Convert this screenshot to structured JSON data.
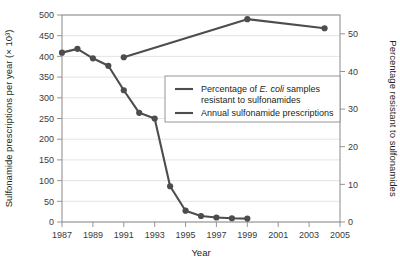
{
  "chart_data": {
    "type": "line",
    "title": "",
    "xlabel": "Year",
    "ylabel": "Sulfonamide prescriptions per year (× 10³)",
    "y2label": "Percentage resistant to sulfonamides",
    "xlim": [
      1987,
      2005
    ],
    "ylim": [
      0,
      500
    ],
    "y2lim": [
      0,
      55
    ],
    "grid": true,
    "legend_position": "center",
    "xticks": [
      1987,
      1989,
      1991,
      1993,
      1995,
      1997,
      1999,
      2001,
      2003,
      2005
    ],
    "xtick_labels": [
      "1987",
      "1989",
      "1991",
      "1993",
      "1995",
      "1997",
      "1999",
      "2001",
      "2003",
      "2005"
    ],
    "yticks": [
      0,
      50,
      100,
      150,
      200,
      250,
      300,
      350,
      400,
      450,
      500
    ],
    "ytick_labels": [
      "0",
      "50",
      "100",
      "150",
      "200",
      "250",
      "300",
      "350",
      "400",
      "450",
      "500"
    ],
    "y2ticks": [
      0,
      10,
      20,
      30,
      40,
      50
    ],
    "y2tick_labels": [
      "0",
      "10",
      "20",
      "30",
      "40",
      "50"
    ],
    "series": [
      {
        "name": "Percentage of E. coli samples resistant to sulfonamides",
        "axis": "right",
        "color": "#4d4d4d",
        "x": [
          1987,
          1988,
          1989,
          1990,
          1991,
          1992,
          1993,
          1994,
          1995,
          1996,
          1997,
          1998,
          1999
        ],
        "values": [
          45.0,
          46.0,
          43.5,
          41.5,
          35.0,
          29.0,
          27.5,
          9.5,
          3.0,
          1.6,
          1.2,
          1.0,
          0.9
        ]
      },
      {
        "name": "Annual sulfonamide prescriptions",
        "axis": "left",
        "color": "#4d4d4d",
        "x": [
          1991,
          1999,
          2004
        ],
        "values": [
          398,
          490,
          468
        ]
      }
    ],
    "legend": [
      {
        "label_parts": [
          "Percentage of ",
          "E. coli",
          " samples"
        ],
        "label_line2": "resistant to sulfonamides",
        "color": "#4d4d4d"
      },
      {
        "label_parts": [
          "Annual sulfonamide prescriptions"
        ],
        "label_line2": "",
        "color": "#4d4d4d"
      }
    ]
  },
  "axes": {
    "left_title": "Sulfonamide prescriptions per year (× 10³)",
    "right_title": "Percentage resistant to sulfonamides",
    "bottom_title": "Year"
  },
  "legend": {
    "item1_line1_a": "Percentage of ",
    "item1_line1_b": "E. coli",
    "item1_line1_c": " samples",
    "item1_line2": "resistant to sulfonamides",
    "item2_line1": "Annual sulfonamide prescriptions"
  },
  "colors": {
    "series": "#4d4d4d",
    "grid": "#d9d9d9",
    "frame": "#8a8a8a",
    "text": "#231f20",
    "background": "#ffffff"
  }
}
